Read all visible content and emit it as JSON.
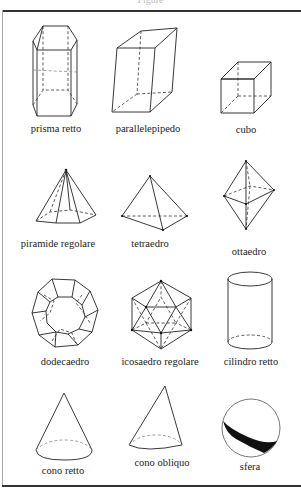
{
  "header": {
    "text": "Figure"
  },
  "figures": [
    {
      "id": "prisma-retto",
      "label": "prisma retto"
    },
    {
      "id": "parallelepipedo",
      "label": "parallelepipedo"
    },
    {
      "id": "cubo",
      "label": "cubo"
    },
    {
      "id": "piramide-regolare",
      "label": "piramide regolare"
    },
    {
      "id": "tetraedro",
      "label": "tetraedro"
    },
    {
      "id": "ottaedro",
      "label": "ottaedro"
    },
    {
      "id": "dodecaedro",
      "label": "dodecaedro"
    },
    {
      "id": "icosaedro-regolare",
      "label": "icosaedro regolare"
    },
    {
      "id": "cilindro-retto",
      "label": "cilindro retto"
    },
    {
      "id": "cono-retto",
      "label": "cono retto"
    },
    {
      "id": "cono-obliquo",
      "label": "cono obliquo"
    },
    {
      "id": "sfera",
      "label": "sfera"
    }
  ],
  "colors": {
    "line": "#222222",
    "frame": "#333333",
    "background": "#ffffff"
  }
}
